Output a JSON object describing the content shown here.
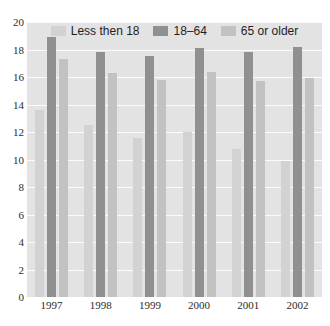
{
  "chart_data": {
    "type": "bar",
    "title": "",
    "subtitle": "",
    "xlabel": "",
    "ylabel": "",
    "categories": [
      "1997",
      "1998",
      "1999",
      "2000",
      "2001",
      "2002"
    ],
    "series": [
      {
        "name": "Less then 18",
        "color": "#d2d2d2",
        "values": [
          13.6,
          12.5,
          11.6,
          12.0,
          10.8,
          9.9
        ]
      },
      {
        "name": "18–64",
        "color": "#909090",
        "values": [
          18.9,
          17.8,
          17.5,
          18.1,
          17.8,
          18.2
        ]
      },
      {
        "name": "65 or older",
        "color": "#c2c2c2",
        "values": [
          17.3,
          16.3,
          15.8,
          16.4,
          15.7,
          15.9
        ]
      }
    ],
    "ylim": [
      0,
      20
    ],
    "yticks": [
      0,
      2,
      4,
      6,
      8,
      10,
      12,
      14,
      16,
      18,
      20
    ],
    "ytick_labels": [
      "0",
      "2",
      "4",
      "6",
      "8",
      "10",
      "12",
      "14",
      "16",
      "18",
      "20"
    ],
    "grid": true,
    "legend_position": "top-center",
    "plot_background": "#e3e3e3",
    "gridline_color": "#fbfbfb"
  }
}
